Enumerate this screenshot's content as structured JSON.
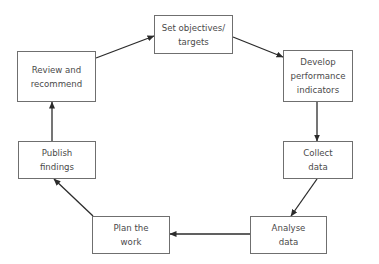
{
  "diagram": {
    "type": "cycle",
    "direction": "clockwise",
    "colors": {
      "box_border": "#6f6f6f",
      "text": "#4a4a4a",
      "arrow": "#2b2b2b",
      "background": "#ffffff"
    },
    "nodes": [
      {
        "id": "set-objectives",
        "lines": [
          "Set objectives/",
          "targets"
        ]
      },
      {
        "id": "develop-indicators",
        "lines": [
          "Develop",
          "performance",
          "indicators"
        ]
      },
      {
        "id": "collect-data",
        "lines": [
          "Collect",
          "data"
        ]
      },
      {
        "id": "analyse-data",
        "lines": [
          "Analyse",
          "data"
        ]
      },
      {
        "id": "plan-work",
        "lines": [
          "Plan the",
          "work"
        ]
      },
      {
        "id": "publish-findings",
        "lines": [
          "Publish",
          "findings"
        ]
      },
      {
        "id": "review-recommend",
        "lines": [
          "Review and",
          "recommend"
        ]
      }
    ],
    "edges": [
      {
        "from": "set-objectives",
        "to": "develop-indicators"
      },
      {
        "from": "develop-indicators",
        "to": "collect-data"
      },
      {
        "from": "collect-data",
        "to": "analyse-data"
      },
      {
        "from": "analyse-data",
        "to": "plan-work"
      },
      {
        "from": "plan-work",
        "to": "publish-findings"
      },
      {
        "from": "publish-findings",
        "to": "review-recommend"
      },
      {
        "from": "review-recommend",
        "to": "set-objectives"
      }
    ]
  }
}
